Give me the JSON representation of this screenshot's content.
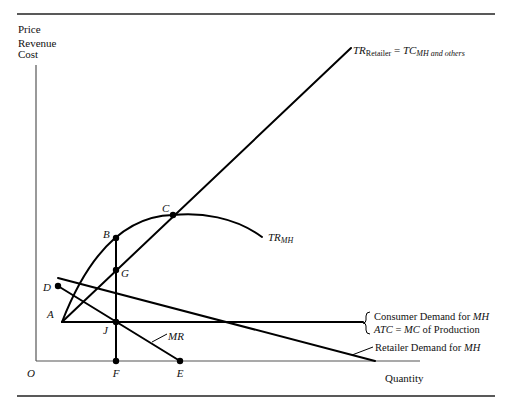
{
  "axes": {
    "y_label_lines": [
      "Price",
      "Revenue",
      "Cost"
    ],
    "x_label": "Quantity",
    "origin": "O"
  },
  "points": {
    "A": "A",
    "B": "B",
    "C": "C",
    "D": "D",
    "E": "E",
    "F": "F",
    "G": "G",
    "J": "J"
  },
  "curves": {
    "tr_retailer": {
      "main": "TR",
      "sub": "Retailer",
      "eq": " = ",
      "tc": "TC",
      "tc_sub": "MH and others"
    },
    "tr_mh": {
      "main": "TR",
      "sub": "MH"
    },
    "mr": "MR",
    "consumer_demand": {
      "line1_prefix": "Consumer Demand for ",
      "line1_em": "MH",
      "line2_atc": "ATC",
      "line2_eq": " = ",
      "line2_mc": "MC",
      "line2_rest": " of Production"
    },
    "retailer_demand": {
      "prefix": "Retailer Demand for ",
      "em": "MH"
    }
  }
}
